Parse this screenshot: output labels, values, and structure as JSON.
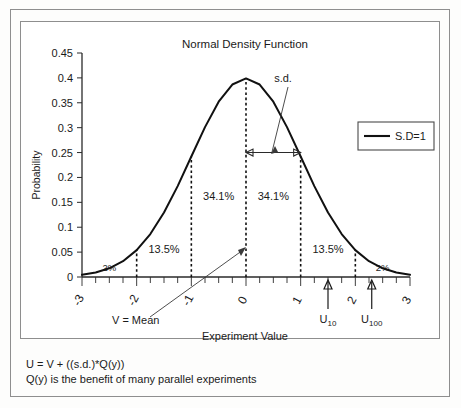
{
  "figure": {
    "caption_line1": "U = V + ((s.d.)*Q(y))",
    "caption_line2": "Q(y) is the benefit of many parallel experiments"
  },
  "chart_data": {
    "type": "line",
    "title": "Normal Density Function",
    "xlabel": "Experiment Value",
    "ylabel": "Probability",
    "xlim": [
      -3,
      3
    ],
    "ylim": [
      0,
      0.45
    ],
    "grid": false,
    "legend_position": "right",
    "series": [
      {
        "name": "S.D=1",
        "mean": 0,
        "sd": 1,
        "x": [
          -3,
          -2.75,
          -2.5,
          -2.25,
          -2,
          -1.75,
          -1.5,
          -1.25,
          -1,
          -0.75,
          -0.5,
          -0.25,
          0,
          0.25,
          0.5,
          0.75,
          1,
          1.25,
          1.5,
          1.75,
          2,
          2.25,
          2.5,
          2.75,
          3
        ],
        "y": [
          0.0044,
          0.0091,
          0.0175,
          0.0317,
          0.054,
          0.0863,
          0.1295,
          0.1826,
          0.242,
          0.3011,
          0.3521,
          0.3867,
          0.3989,
          0.3867,
          0.3521,
          0.3011,
          0.242,
          0.1826,
          0.1295,
          0.0863,
          0.054,
          0.0317,
          0.0175,
          0.0091,
          0.0044
        ]
      }
    ],
    "yticks": [
      "0",
      "0.05",
      "0.1",
      "0.15",
      "0.2",
      "0.25",
      "0.3",
      "0.35",
      "0.4",
      "0.45"
    ],
    "ytick_values": [
      0,
      0.05,
      0.1,
      0.15,
      0.2,
      0.25,
      0.3,
      0.35,
      0.4,
      0.45
    ],
    "xticks": [
      "-3",
      "-2",
      "-1",
      "0",
      "1",
      "2",
      "3"
    ],
    "xtick_values": [
      -3,
      -2,
      -1,
      0,
      1,
      2,
      3
    ],
    "legend": [
      {
        "label": "S.D=1",
        "color": "#111111"
      }
    ],
    "annotations": {
      "sd_label": "s.d.",
      "mean_label": "V = Mean",
      "u10_label": "U",
      "u10_sub": "10",
      "u100_label": "U",
      "u100_sub": "100",
      "bands": [
        {
          "label": "2%",
          "x_center": -2.5
        },
        {
          "label": "13.5%",
          "x_center": -1.5
        },
        {
          "label": "34.1%",
          "x_center": -0.5
        },
        {
          "label": "34.1%",
          "x_center": 0.5
        },
        {
          "label": "13.5%",
          "x_center": 1.5
        },
        {
          "label": "2%",
          "x_center": 2.5
        }
      ],
      "dashed_verticals": [
        -2,
        -1,
        0,
        1,
        2
      ],
      "sd_span": [
        0,
        1
      ],
      "sd_span_y": 0.25,
      "u10_x": 1.5,
      "u100_x": 2.3
    }
  }
}
